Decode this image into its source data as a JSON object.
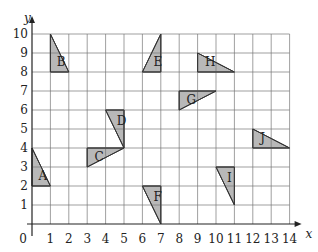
{
  "chart_data": {
    "type": "diagram",
    "title": "",
    "xlabel": "x",
    "ylabel": "y",
    "xlim": [
      0,
      14
    ],
    "ylim": [
      0,
      10
    ],
    "grid": true,
    "x_ticks": [
      "0",
      "1",
      "2",
      "3",
      "4",
      "5",
      "6",
      "7",
      "8",
      "9",
      "10",
      "11",
      "12",
      "13",
      "14"
    ],
    "y_ticks": [
      "1",
      "2",
      "3",
      "4",
      "5",
      "6",
      "7",
      "8",
      "9",
      "10"
    ],
    "shapes": [
      {
        "label": "A",
        "points": [
          [
            0,
            2
          ],
          [
            0,
            4
          ],
          [
            1,
            2
          ]
        ],
        "label_pos": [
          0.35,
          2.6
        ]
      },
      {
        "label": "B",
        "points": [
          [
            1,
            8
          ],
          [
            1,
            10
          ],
          [
            2,
            8
          ]
        ],
        "label_pos": [
          1.35,
          8.6
        ]
      },
      {
        "label": "C",
        "points": [
          [
            3,
            3
          ],
          [
            3,
            4
          ],
          [
            5,
            4
          ]
        ],
        "label_pos": [
          3.4,
          3.6
        ]
      },
      {
        "label": "D",
        "points": [
          [
            4,
            6
          ],
          [
            5,
            6
          ],
          [
            5,
            4
          ]
        ],
        "label_pos": [
          4.6,
          5.5
        ]
      },
      {
        "label": "E",
        "points": [
          [
            6,
            8
          ],
          [
            7,
            8
          ],
          [
            7,
            10
          ]
        ],
        "label_pos": [
          6.6,
          8.6
        ]
      },
      {
        "label": "F",
        "points": [
          [
            6,
            2
          ],
          [
            7,
            2
          ],
          [
            7,
            0
          ]
        ],
        "label_pos": [
          6.6,
          1.5
        ]
      },
      {
        "label": "G",
        "points": [
          [
            8,
            6
          ],
          [
            8,
            7
          ],
          [
            10,
            7
          ]
        ],
        "label_pos": [
          8.4,
          6.6
        ]
      },
      {
        "label": "H",
        "points": [
          [
            9,
            9
          ],
          [
            9,
            8
          ],
          [
            11,
            8
          ]
        ],
        "label_pos": [
          9.4,
          8.6
        ]
      },
      {
        "label": "I",
        "points": [
          [
            10,
            3
          ],
          [
            11,
            3
          ],
          [
            11,
            1
          ]
        ],
        "label_pos": [
          10.6,
          2.5
        ]
      },
      {
        "label": "J",
        "points": [
          [
            12,
            5
          ],
          [
            12,
            4
          ],
          [
            14,
            4
          ]
        ],
        "label_pos": [
          12.4,
          4.6
        ]
      }
    ],
    "fill_color": "#b8b8b8",
    "grid_color": "#777777"
  }
}
